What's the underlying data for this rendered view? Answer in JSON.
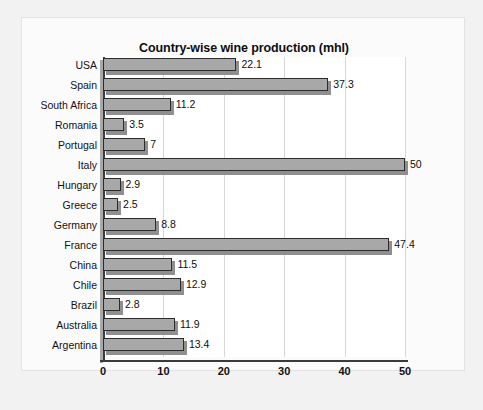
{
  "chart_data": {
    "type": "bar",
    "orientation": "horizontal",
    "title": "Country-wise wine production (mhl)",
    "xlabel": "",
    "ylabel": "",
    "xlim": [
      0,
      50
    ],
    "xticks": [
      "0",
      "10",
      "20",
      "30",
      "40",
      "50"
    ],
    "xtick_values": [
      0,
      10,
      20,
      30,
      40,
      50
    ],
    "grid": "vertical",
    "legend": "none",
    "categories": [
      "USA",
      "Spain",
      "South Africa",
      "Romania",
      "Portugal",
      "Italy",
      "Hungary",
      "Greece",
      "Germany",
      "France",
      "China",
      "Chile",
      "Brazil",
      "Australia",
      "Argentina"
    ],
    "values": [
      22.1,
      37.3,
      11.2,
      3.5,
      7,
      50,
      2.9,
      2.5,
      8.8,
      47.4,
      11.5,
      12.9,
      2.8,
      11.9,
      13.4
    ],
    "data_labels": [
      "22.1",
      "37.3",
      "11.2",
      "3.5",
      "7",
      "50",
      "2.9",
      "2.5",
      "8.8",
      "47.4",
      "11.5",
      "12.9",
      "2.8",
      "11.9",
      "13.4"
    ],
    "colors": {
      "bar_fill": "#a8a8a8",
      "bar_border": "#2c2c2c",
      "bar_shadow": "#8f8f8f",
      "plot_background": "#ffffff",
      "frame_background": "#fbfbfb",
      "figure_background": "#f2f2f2",
      "gridline": "#d8d8d8",
      "axis_line": "#3b3b3b",
      "text": "#111111"
    }
  }
}
